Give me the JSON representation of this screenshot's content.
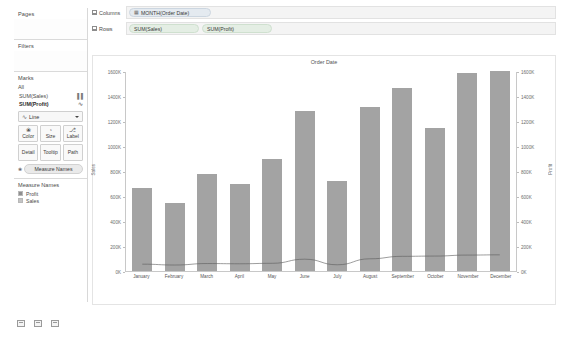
{
  "left_panel": {
    "pages": {
      "title": "Pages"
    },
    "filters": {
      "title": "Filters"
    },
    "marks": {
      "title": "Marks",
      "all_label": "All",
      "measures": [
        {
          "label": "SUM(Sales)",
          "glyph": "▐▐"
        },
        {
          "label": "SUM(Profit)",
          "glyph": "∿"
        }
      ],
      "mark_type": "Line",
      "mark_type_glyph": "∿",
      "buttons": [
        {
          "label": "Color",
          "icon": "❀"
        },
        {
          "label": "Size",
          "icon": "◔"
        },
        {
          "label": "Label",
          "icon": "⎇"
        },
        {
          "label": "Detail",
          "icon": ""
        },
        {
          "label": "Tooltip",
          "icon": ""
        },
        {
          "label": "Path",
          "icon": ""
        }
      ],
      "measure_names_pill": "Measure Names",
      "measure_names_icon": "❀"
    },
    "legend": {
      "title": "Measure Names",
      "items": [
        {
          "label": "Profit",
          "color": "#8f8f8f"
        },
        {
          "label": "Sales",
          "color": "#bdbdbd"
        }
      ]
    },
    "sheet_tabs": [
      "new-worksheet-icon",
      "new-dashboard-icon",
      "new-story-icon"
    ]
  },
  "shelves": {
    "columns": {
      "label": "Columns",
      "pills": [
        {
          "text": "MONTH(Order Date)",
          "icon": "▦",
          "kind": "blue"
        }
      ]
    },
    "rows": {
      "label": "Rows",
      "pills": [
        {
          "text": "SUM(Sales)",
          "icon": "",
          "kind": "green"
        },
        {
          "text": "SUM(Profit)",
          "icon": "",
          "kind": "green"
        }
      ]
    }
  },
  "chart_data": {
    "type": "bar",
    "title": "Order Date",
    "xlabel": "",
    "ylabel": "Sales",
    "y2label": "Profit",
    "ylim": [
      0,
      1600000
    ],
    "y2lim": [
      0,
      1600000
    ],
    "grid": false,
    "legend_position": "left-panel",
    "categories": [
      "January",
      "February",
      "March",
      "April",
      "May",
      "June",
      "July",
      "August",
      "September",
      "October",
      "November",
      "December"
    ],
    "tick_labels": [
      "0K",
      "200K",
      "400K",
      "600K",
      "800K",
      "1000K",
      "1200K",
      "1400K",
      "1600K"
    ],
    "tick_values": [
      0,
      200000,
      400000,
      600000,
      800000,
      1000000,
      1200000,
      1400000,
      1600000
    ],
    "series": [
      {
        "name": "Sales",
        "type": "bar",
        "color": "#a3a3a3",
        "axis": "left",
        "values": [
          670000,
          550000,
          780000,
          700000,
          900000,
          1290000,
          720000,
          1320000,
          1470000,
          1150000,
          1590000,
          1610000
        ]
      },
      {
        "name": "Profit",
        "type": "line",
        "color": "#5a5a5a",
        "axis": "right",
        "values": [
          55000,
          48000,
          60000,
          58000,
          62000,
          95000,
          50000,
          98000,
          118000,
          120000,
          128000,
          130000
        ]
      }
    ]
  }
}
